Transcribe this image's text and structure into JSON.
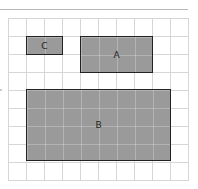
{
  "diagram": {
    "grid": {
      "columns": 10,
      "rows": 9,
      "cell_px": 18
    },
    "rectangles": [
      {
        "id": "C",
        "label": "C",
        "col": 1,
        "row": 1,
        "width_cells": 2,
        "height_cells": 1
      },
      {
        "id": "A",
        "label": "A",
        "col": 4,
        "row": 1,
        "width_cells": 4,
        "height_cells": 2
      },
      {
        "id": "B",
        "label": "B",
        "col": 1,
        "row": 4,
        "width_cells": 8,
        "height_cells": 4
      }
    ],
    "fill_color": "#9a9a9a",
    "border_color": "#222222"
  }
}
